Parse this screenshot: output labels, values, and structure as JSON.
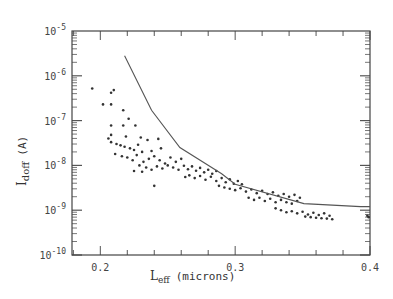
{
  "chart_data": {
    "type": "scatter",
    "title": "",
    "xlabel": "L_eff (microns)",
    "xlabel_main": "L",
    "xlabel_sub": "eff",
    "xlabel_units": "(microns)",
    "ylabel": "I_doff (A)",
    "ylabel_main": "I",
    "ylabel_sub": "doff",
    "ylabel_units": "(A)",
    "xscale": "linear",
    "yscale": "log",
    "xlim": [
      0.179,
      0.4
    ],
    "ylim": [
      1e-10,
      1e-05
    ],
    "x_ticks": [
      0.2,
      0.3,
      0.4
    ],
    "x_tick_labels": [
      "0.2",
      "0.3",
      "0.4"
    ],
    "y_ticks": [
      1e-05,
      1e-06,
      1e-07,
      1e-08,
      1e-09,
      1e-10
    ],
    "y_tick_labels": [
      {
        "base": "10",
        "exp": "-5"
      },
      {
        "base": "10",
        "exp": "-6"
      },
      {
        "base": "10",
        "exp": "-7"
      },
      {
        "base": "10",
        "exp": "-8"
      },
      {
        "base": "10",
        "exp": "-9"
      },
      {
        "base": "10",
        "exp": "-10"
      }
    ],
    "grid": false,
    "legend": null,
    "series": [
      {
        "name": "measured devices",
        "type": "scatter",
        "marker": "dot",
        "points": [
          [
            0.194,
            5.2e-07
          ],
          [
            0.208,
            4.2e-07
          ],
          [
            0.21,
            4.8e-07
          ],
          [
            0.202,
            2.3e-07
          ],
          [
            0.208,
            2.3e-07
          ],
          [
            0.217,
            1.7e-07
          ],
          [
            0.221,
            1.1e-07
          ],
          [
            0.208,
            7.8e-08
          ],
          [
            0.217,
            7.8e-08
          ],
          [
            0.226,
            7.8e-08
          ],
          [
            0.208,
            4.8e-08
          ],
          [
            0.219,
            4.4e-08
          ],
          [
            0.206,
            4e-08
          ],
          [
            0.208,
            3.3e-08
          ],
          [
            0.23,
            4.2e-08
          ],
          [
            0.243,
            3.9e-08
          ],
          [
            0.235,
            3.7e-08
          ],
          [
            0.212,
            3e-08
          ],
          [
            0.215,
            2.8e-08
          ],
          [
            0.218,
            2.6e-08
          ],
          [
            0.222,
            2.4e-08
          ],
          [
            0.225,
            2.2e-08
          ],
          [
            0.228,
            2.9e-08
          ],
          [
            0.231,
            2e-08
          ],
          [
            0.238,
            2.1e-08
          ],
          [
            0.245,
            2.4e-08
          ],
          [
            0.211,
            1.8e-08
          ],
          [
            0.216,
            1.6e-08
          ],
          [
            0.22,
            1.5e-08
          ],
          [
            0.224,
            1.3e-08
          ],
          [
            0.227,
            1.7e-08
          ],
          [
            0.232,
            1.2e-08
          ],
          [
            0.236,
            1.4e-08
          ],
          [
            0.24,
            1.6e-08
          ],
          [
            0.244,
            1.3e-08
          ],
          [
            0.248,
            1.1e-08
          ],
          [
            0.252,
            1.5e-08
          ],
          [
            0.256,
            1.2e-08
          ],
          [
            0.26,
            1.4e-08
          ],
          [
            0.229,
            1e-08
          ],
          [
            0.234,
            9e-09
          ],
          [
            0.238,
            8e-09
          ],
          [
            0.242,
            9.5e-09
          ],
          [
            0.246,
            8.5e-09
          ],
          [
            0.25,
            1e-08
          ],
          [
            0.254,
            9e-09
          ],
          [
            0.258,
            8e-09
          ],
          [
            0.262,
            9.8e-09
          ],
          [
            0.225,
            7.5e-09
          ],
          [
            0.231,
            7.2e-09
          ],
          [
            0.265,
            8.2e-09
          ],
          [
            0.268,
            9.5e-09
          ],
          [
            0.271,
            7.6e-09
          ],
          [
            0.274,
            8.8e-09
          ],
          [
            0.277,
            7e-09
          ],
          [
            0.28,
            8e-09
          ],
          [
            0.283,
            6.5e-09
          ],
          [
            0.286,
            7.5e-09
          ],
          [
            0.24,
            3.5e-09
          ],
          [
            0.263,
            5.5e-09
          ],
          [
            0.266,
            6e-09
          ],
          [
            0.27,
            5.2e-09
          ],
          [
            0.274,
            5.8e-09
          ],
          [
            0.278,
            4.8e-09
          ],
          [
            0.282,
            5.6e-09
          ],
          [
            0.286,
            4.5e-09
          ],
          [
            0.29,
            5.2e-09
          ],
          [
            0.293,
            4.2e-09
          ],
          [
            0.296,
            4.9e-09
          ],
          [
            0.299,
            3.9e-09
          ],
          [
            0.302,
            4.5e-09
          ],
          [
            0.305,
            3.8e-09
          ],
          [
            0.288,
            3.5e-09
          ],
          [
            0.292,
            3.2e-09
          ],
          [
            0.296,
            3e-09
          ],
          [
            0.3,
            2.8e-09
          ],
          [
            0.304,
            3.1e-09
          ],
          [
            0.308,
            2.6e-09
          ],
          [
            0.312,
            2.9e-09
          ],
          [
            0.316,
            2.4e-09
          ],
          [
            0.32,
            2.7e-09
          ],
          [
            0.324,
            2.3e-09
          ],
          [
            0.328,
            2.5e-09
          ],
          [
            0.332,
            2.1e-09
          ],
          [
            0.336,
            2.3e-09
          ],
          [
            0.34,
            2e-09
          ],
          [
            0.344,
            2.2e-09
          ],
          [
            0.348,
            1.9e-09
          ],
          [
            0.31,
            1.9e-09
          ],
          [
            0.314,
            1.7e-09
          ],
          [
            0.318,
            1.9e-09
          ],
          [
            0.322,
            1.6e-09
          ],
          [
            0.326,
            1.8e-09
          ],
          [
            0.33,
            1.5e-09
          ],
          [
            0.334,
            1.7e-09
          ],
          [
            0.338,
            1.5e-09
          ],
          [
            0.342,
            1.4e-09
          ],
          [
            0.346,
            1.6e-09
          ],
          [
            0.33,
            1.1e-09
          ],
          [
            0.334,
            1e-09
          ],
          [
            0.338,
            9e-10
          ],
          [
            0.342,
            9.5e-10
          ],
          [
            0.346,
            8.5e-10
          ],
          [
            0.35,
            9.2e-10
          ],
          [
            0.354,
            8e-10
          ],
          [
            0.358,
            8.8e-10
          ],
          [
            0.362,
            7.8e-10
          ],
          [
            0.366,
            8.5e-10
          ],
          [
            0.37,
            7.5e-10
          ],
          [
            0.352,
            7.2e-10
          ],
          [
            0.356,
            7e-10
          ],
          [
            0.36,
            6.8e-10
          ],
          [
            0.364,
            6.6e-10
          ],
          [
            0.368,
            6.5e-10
          ],
          [
            0.372,
            6.3e-10
          ],
          [
            0.398,
            7.5e-10
          ],
          [
            0.399,
            7e-10
          ]
        ]
      },
      {
        "name": "upper bound",
        "type": "line",
        "x": [
          0.218,
          0.238,
          0.259,
          0.29,
          0.3,
          0.351,
          0.393,
          0.4
        ],
        "y": [
          2.8e-06,
          1.7e-07,
          2.5e-08,
          6.5e-09,
          3.8e-09,
          1.4e-09,
          1.2e-09,
          1.2e-09
        ]
      }
    ],
    "layout": {
      "plot_left_px": 72,
      "plot_right_px": 370,
      "plot_top_px": 31,
      "plot_bottom_px": 255
    }
  }
}
